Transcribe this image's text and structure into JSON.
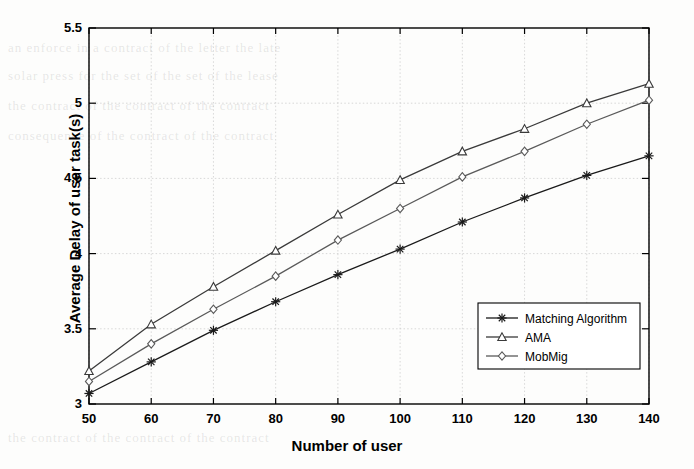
{
  "chart_data": {
    "type": "line",
    "title": "",
    "xlabel": "Number of user",
    "ylabel": "Average Delay of user task(s)",
    "x": [
      50,
      60,
      70,
      80,
      90,
      100,
      110,
      120,
      130,
      140
    ],
    "xlim": [
      50,
      140
    ],
    "ylim": [
      3,
      5.5
    ],
    "xticks": [
      "50",
      "60",
      "70",
      "80",
      "90",
      "100",
      "110",
      "120",
      "130",
      "140"
    ],
    "yticks": [
      "3",
      "3.5",
      "4",
      "4.5",
      "5",
      "5.5"
    ],
    "grid": true,
    "legend_position": "lower right",
    "series": [
      {
        "name": "Matching Algorithm",
        "marker": "star",
        "color": "#1a1a1a",
        "values": [
          3.07,
          3.28,
          3.49,
          3.68,
          3.86,
          4.03,
          4.21,
          4.37,
          4.52,
          4.65
        ]
      },
      {
        "name": "AMA",
        "marker": "triangle",
        "color": "#3a3a3a",
        "values": [
          3.22,
          3.53,
          3.78,
          4.02,
          4.26,
          4.49,
          4.68,
          4.83,
          5.0,
          5.13
        ]
      },
      {
        "name": "MobMig",
        "marker": "diamond",
        "color": "#5a5a5a",
        "values": [
          3.15,
          3.4,
          3.63,
          3.85,
          4.09,
          4.3,
          4.51,
          4.68,
          4.86,
          5.02
        ]
      }
    ]
  },
  "legend": {
    "items": [
      {
        "label": "Matching Algorithm"
      },
      {
        "label": "AMA"
      },
      {
        "label": "MobMig"
      }
    ]
  },
  "axes": {
    "x_title": "Number of user",
    "y_title": "Average Delay of user task(s)"
  },
  "background_text": {
    "lines": [
      "an enforce in a contract of the letter the late",
      "solar press for the set of the set  of the lease",
      "the contract of the contract of the contract",
      "consequence of the contract of the contract",
      "the contract of the contract of the contract"
    ]
  }
}
